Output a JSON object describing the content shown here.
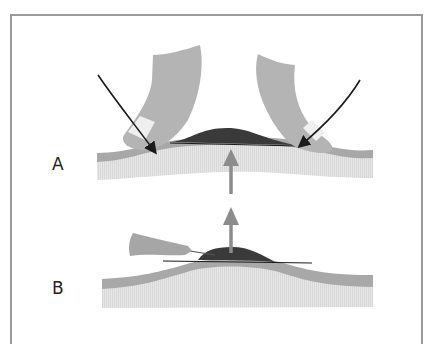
{
  "figure": {
    "panels": [
      {
        "id": "A",
        "label": "A"
      },
      {
        "id": "B",
        "label": "B"
      }
    ],
    "colors": {
      "frame": "#9a9a9a",
      "finger": "#b4b4b4",
      "nail": "#efefef",
      "epidermis": "#a8a8a8",
      "dermis": "#e2e2e2",
      "lesion": "#3a3a3a",
      "arrow_force": "#8c8c8c",
      "arrow_pointer": "#1a1a1a",
      "needle_hub": "#a6a6a6"
    }
  }
}
